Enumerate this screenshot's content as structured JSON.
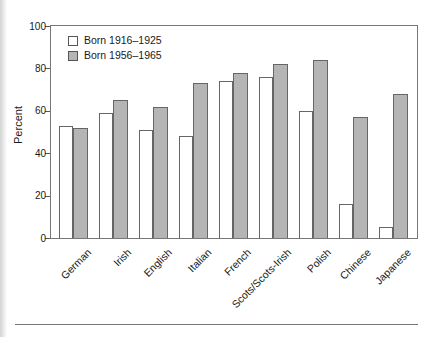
{
  "chart_data": {
    "type": "bar",
    "title": "",
    "ylabel": "Percent",
    "ylim": [
      0,
      100
    ],
    "yticks": [
      0,
      20,
      40,
      60,
      80,
      100
    ],
    "grid": false,
    "legend_position": "upper-left",
    "categories": [
      "German",
      "Irish",
      "English",
      "Italian",
      "French",
      "Scots/Scots-Irish",
      "Polish",
      "Chinese",
      "Japanese"
    ],
    "series": [
      {
        "name": "Born 1916–1925",
        "fill": "#ffffff",
        "values": [
          53,
          59,
          51,
          48,
          74,
          76,
          60,
          16,
          5
        ]
      },
      {
        "name": "Born 1956–1965",
        "fill": "#b5b5b5",
        "values": [
          52,
          65,
          62,
          73,
          78,
          82,
          84,
          57,
          68
        ]
      }
    ]
  },
  "colors": {
    "bar_outline": "#666666",
    "axis_frame": "#777777",
    "text": "#1a1a1a",
    "divider": "#777777"
  }
}
